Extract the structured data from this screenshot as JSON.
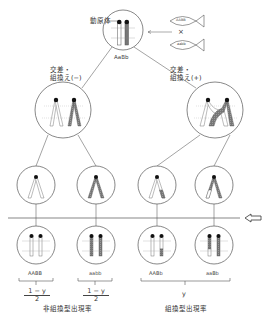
{
  "diagram": {
    "centromere_label": "動原体",
    "parent": {
      "genotype": "AaBb"
    },
    "cross": {
      "symbol": "×",
      "fish": [
        {
          "genotype": "AABB"
        },
        {
          "genotype": "aabb"
        }
      ]
    },
    "branches": [
      {
        "label_line1": "交差・",
        "label_line2": "組換え(−)"
      },
      {
        "label_line1": "交差・",
        "label_line2": "組換え(+)"
      }
    ],
    "gene_labels": {
      "A": "A",
      "a": "a",
      "B": "B",
      "b": "b"
    },
    "gametes": [
      {
        "genotype": "AABB",
        "fraction_num": "1 − y",
        "fraction_den": "2"
      },
      {
        "genotype": "aabb",
        "fraction_num": "1 − y",
        "fraction_den": "2"
      },
      {
        "genotype": "AABb"
      },
      {
        "genotype": "aaBb"
      }
    ],
    "recombinant_fraction": "y",
    "captions": {
      "non_recombinant": "非組換型出現率",
      "recombinant": "組換型出現率"
    },
    "colors": {
      "line": "#555555",
      "dark_chromatid": "#666666",
      "light_chromatid": "#ffffff",
      "centromere": "#111111"
    }
  }
}
